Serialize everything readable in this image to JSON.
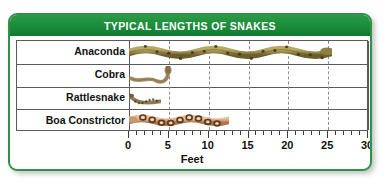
{
  "header": {
    "title": "TYPICAL LENGTHS OF SNAKES",
    "bg_color": "#198c3a",
    "text_color": "#ffffff"
  },
  "card": {
    "border_color": "#2f9347",
    "background": "#ffffff"
  },
  "axis": {
    "title": "Feet",
    "tick_labels": [
      "0",
      "5",
      "10",
      "15",
      "20",
      "25",
      "30"
    ],
    "tick_values": [
      0,
      5,
      10,
      15,
      20,
      25,
      30
    ],
    "minor_tick_step": 1,
    "min": 0,
    "max": 30
  },
  "rows": [
    {
      "label": "Anaconda",
      "length": 25.5,
      "icon": "anaconda-snake-icon"
    },
    {
      "label": "Cobra",
      "length": 5.8,
      "icon": "cobra-snake-icon"
    },
    {
      "label": "Rattlesnake",
      "length": 4.0,
      "icon": "rattlesnake-snake-icon"
    },
    {
      "label": "Boa Constrictor",
      "length": 12.5,
      "icon": "boa-constrictor-snake-icon"
    }
  ],
  "chart_data": {
    "type": "bar",
    "title": "TYPICAL LENGTHS OF SNAKES",
    "xlabel": "Feet",
    "ylabel": "",
    "categories": [
      "Anaconda",
      "Cobra",
      "Rattlesnake",
      "Boa Constrictor"
    ],
    "values": [
      25.5,
      5.8,
      4.0,
      12.5
    ],
    "xlim": [
      0,
      30
    ],
    "xticks": [
      0,
      5,
      10,
      15,
      20,
      25,
      30
    ],
    "xtick_labels": [
      "0",
      "5",
      "10",
      "15",
      "20",
      "25",
      "30"
    ],
    "minor_xticks_step": 1,
    "grid": "vertical dashed gridlines at every 5 feet",
    "legend": "none",
    "units": "feet",
    "orientation": "horizontal"
  },
  "colors": {
    "header_green": "#198c3a",
    "border_green": "#2f9347",
    "grid_line": "#5a5a5a",
    "dashed_grid": "#8d8d8d",
    "text": "#111111",
    "anaconda_body": "#9a8a4e",
    "anaconda_dark": "#5d5024",
    "cobra_body": "#a58a63",
    "rattlesnake_body": "#8d7a55",
    "boa_body": "#d9a173",
    "boa_dark": "#5a3a22"
  }
}
